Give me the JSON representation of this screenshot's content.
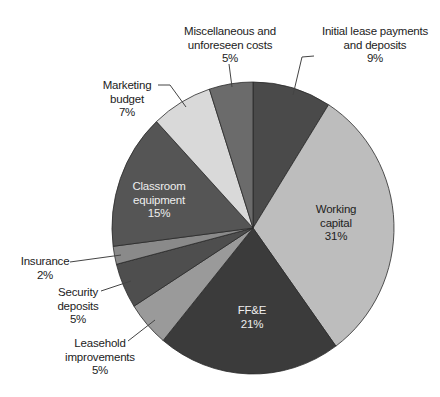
{
  "chart_data": {
    "type": "pie",
    "title": "",
    "start_angle_deg": 0,
    "direction": "clockwise",
    "slices": [
      {
        "label": "Initial lease payments and deposits",
        "label_lines": [
          "Initial lease payments",
          "and deposits",
          "9%"
        ],
        "value": 9,
        "color": "#4a4a4a",
        "label_pos": "outside",
        "text_x": 375,
        "text_y": 35,
        "text_color": "dark",
        "leader": [
          [
            314,
            56
          ],
          [
            302,
            57
          ],
          [
            293,
            95
          ]
        ]
      },
      {
        "label": "Working capital",
        "label_lines": [
          "Working",
          "capital",
          "31%"
        ],
        "value": 31,
        "color": "#bdbdbd",
        "label_pos": "inside",
        "text_x": 336,
        "text_y": 213,
        "text_color": "dark",
        "leader": []
      },
      {
        "label": "FF&E",
        "label_lines": [
          "FF&E",
          "21%"
        ],
        "value": 21,
        "color": "#3b3b3b",
        "label_pos": "inside",
        "text_x": 252,
        "text_y": 314,
        "text_color": "light",
        "leader": []
      },
      {
        "label": "Leasehold improvements",
        "label_lines": [
          "Leasehold",
          "improvements",
          "5%"
        ],
        "value": 5,
        "color": "#9a9a9a",
        "label_pos": "outside",
        "text_x": 100,
        "text_y": 347,
        "text_color": "dark",
        "leader": [
          [
            128,
            341
          ],
          [
            155,
            320
          ]
        ]
      },
      {
        "label": "Security deposits",
        "label_lines": [
          "Security",
          "deposits",
          "5%"
        ],
        "value": 5,
        "color": "#4e4e4e",
        "label_pos": "outside",
        "text_x": 78,
        "text_y": 296,
        "text_color": "dark",
        "leader": [
          [
            101,
            291
          ],
          [
            131,
            281
          ]
        ]
      },
      {
        "label": "Insurance",
        "label_lines": [
          "Insurance",
          "2%"
        ],
        "value": 2,
        "color": "#8a8a8a",
        "label_pos": "outside",
        "text_x": 45,
        "text_y": 265,
        "text_color": "dark",
        "leader": [
          [
            70,
            262
          ],
          [
            121,
            255
          ]
        ]
      },
      {
        "label": "Classroom equipment",
        "label_lines": [
          "Classroom",
          "equipment",
          "15%"
        ],
        "value": 15,
        "color": "#555555",
        "label_pos": "inside",
        "text_x": 159,
        "text_y": 190,
        "text_color": "light",
        "leader": []
      },
      {
        "label": "Marketing budget",
        "label_lines": [
          "Marketing",
          "budget",
          "7%"
        ],
        "value": 7,
        "color": "#d9d9d9",
        "label_pos": "outside",
        "text_x": 127,
        "text_y": 89,
        "text_color": "dark",
        "leader": [
          [
            158,
            85
          ],
          [
            170,
            85
          ],
          [
            186,
            107
          ]
        ]
      },
      {
        "label": "Miscellaneous and unforeseen costs",
        "label_lines": [
          "Miscellaneous and",
          "unforeseen costs",
          "5%"
        ],
        "value": 5,
        "color": "#6b6b6b",
        "label_pos": "outside",
        "text_x": 230,
        "text_y": 35,
        "text_color": "dark",
        "leader": [
          [
            229,
            64
          ],
          [
            232,
            87
          ]
        ]
      }
    ],
    "legend": "none",
    "geometry": {
      "cx": 253,
      "cy": 228,
      "rx": 141,
      "ry": 146
    }
  }
}
